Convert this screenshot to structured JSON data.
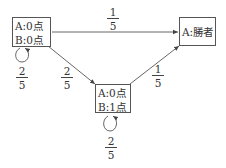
{
  "diagram": {
    "type": "state-transition",
    "nodes": [
      {
        "id": "start",
        "lines": [
          "A:0点",
          "B:0点"
        ]
      },
      {
        "id": "winner",
        "lines": [
          "A:勝者"
        ]
      },
      {
        "id": "mid",
        "lines": [
          "A:0点",
          "B:1点"
        ]
      }
    ],
    "edges": [
      {
        "from": "start",
        "to": "winner",
        "prob": {
          "num": "1",
          "den": "5"
        }
      },
      {
        "from": "start",
        "to": "start",
        "prob": {
          "num": "2",
          "den": "5"
        }
      },
      {
        "from": "start",
        "to": "mid",
        "prob": {
          "num": "2",
          "den": "5"
        }
      },
      {
        "from": "mid",
        "to": "winner",
        "prob": {
          "num": "1",
          "den": "5"
        }
      },
      {
        "from": "mid",
        "to": "mid",
        "prob": {
          "num": "2",
          "den": "5"
        }
      }
    ]
  }
}
